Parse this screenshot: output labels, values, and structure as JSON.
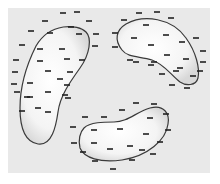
{
  "diagram": {
    "colors": {
      "background": "#ffffff",
      "panel": "#e9e9e9",
      "outline": "#3a3a3a",
      "charge": "#222222",
      "fill_center": "#ffffff",
      "fill_edge": "#dcdcdc"
    },
    "regions": [
      {
        "id": "top-left",
        "path": "M36,46 C28,62 20,84 20,108 C20,130 26,142 38,144 C52,146 56,126 58,112 C60,96 70,82 80,68 C90,54 92,38 86,32 C78,24 50,22 36,46 Z",
        "charges_inside": [
          [
            50,
            33
          ],
          [
            71,
            27
          ],
          [
            79,
            34
          ],
          [
            62,
            49
          ],
          [
            40,
            49
          ],
          [
            40,
            61
          ],
          [
            67,
            59
          ],
          [
            48,
            71
          ],
          [
            60,
            79
          ],
          [
            30,
            83
          ],
          [
            48,
            92
          ],
          [
            67,
            85
          ],
          [
            30,
            97
          ],
          [
            38,
            108
          ],
          [
            48,
            112
          ],
          [
            65,
            95
          ]
        ],
        "charges_outside": [
          [
            63,
            13
          ],
          [
            77,
            12
          ],
          [
            45,
            21
          ],
          [
            89,
            21
          ],
          [
            31,
            31
          ],
          [
            96,
            34
          ],
          [
            22,
            45
          ],
          [
            95,
            46
          ],
          [
            16,
            60
          ],
          [
            82,
            60
          ],
          [
            15,
            72
          ],
          [
            14,
            84
          ],
          [
            70,
            72
          ],
          [
            17,
            92
          ],
          [
            27,
            97
          ],
          [
            68,
            98
          ],
          [
            22,
            111
          ]
        ]
      },
      {
        "id": "top-right",
        "path": "M126,24 C144,14 172,18 186,38 C196,52 200,68 198,78 C196,86 186,86 180,82 C170,74 164,64 152,60 C140,56 128,58 122,50 C114,40 116,30 126,24 Z",
        "charges_inside": [
          [
            146,
            25
          ],
          [
            166,
            35
          ],
          [
            134,
            38
          ],
          [
            182,
            42
          ],
          [
            151,
            45
          ],
          [
            167,
            55
          ],
          [
            186,
            59
          ],
          [
            136,
            62
          ],
          [
            180,
            68
          ],
          [
            154,
            62
          ],
          [
            176,
            71
          ]
        ],
        "charges_outside": [
          [
            139,
            13
          ],
          [
            157,
            12
          ],
          [
            171,
            18
          ],
          [
            124,
            20
          ],
          [
            115,
            33
          ],
          [
            196,
            38
          ],
          [
            115,
            47
          ],
          [
            203,
            51
          ],
          [
            203,
            62
          ],
          [
            130,
            60
          ],
          [
            151,
            65
          ],
          [
            200,
            71
          ],
          [
            162,
            74
          ],
          [
            193,
            76
          ],
          [
            187,
            88
          ],
          [
            172,
            85
          ]
        ]
      },
      {
        "id": "bottom-center",
        "path": "M84,128 C90,122 104,122 114,122 C128,122 136,112 150,108 C164,104 170,114 168,124 C166,140 148,156 122,160 C100,163 84,158 80,148 C78,140 80,132 84,128 Z",
        "charges_inside": [
          [
            94,
            130
          ],
          [
            120,
            129
          ],
          [
            146,
            134
          ],
          [
            94,
            143
          ],
          [
            110,
            149
          ],
          [
            130,
            146
          ],
          [
            150,
            118
          ],
          [
            142,
            150
          ]
        ],
        "charges_outside": [
          [
            136,
            103
          ],
          [
            154,
            104
          ],
          [
            122,
            110
          ],
          [
            166,
            114
          ],
          [
            85,
            117
          ],
          [
            104,
            117
          ],
          [
            73,
            127
          ],
          [
            168,
            130
          ],
          [
            74,
            143
          ],
          [
            160,
            142
          ],
          [
            83,
            152
          ],
          [
            153,
            154
          ],
          [
            95,
            161
          ],
          [
            132,
            160
          ],
          [
            113,
            169
          ]
        ]
      }
    ]
  }
}
